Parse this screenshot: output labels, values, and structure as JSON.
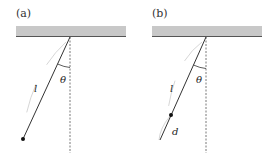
{
  "figure": {
    "colors": {
      "ceiling_fill": "#c8c8c8",
      "ceiling_edge": "#555555",
      "rod": "#333333",
      "bob": "#111111",
      "vertical": "#555555",
      "arc_guide": "#cccccc"
    },
    "panels": [
      {
        "id": "a",
        "label": "(a)",
        "length_label": "l",
        "angle_label": "θ",
        "offset_label": null
      },
      {
        "id": "b",
        "label": "(b)",
        "length_label": "l",
        "angle_label": "θ",
        "offset_label": "d"
      }
    ]
  }
}
